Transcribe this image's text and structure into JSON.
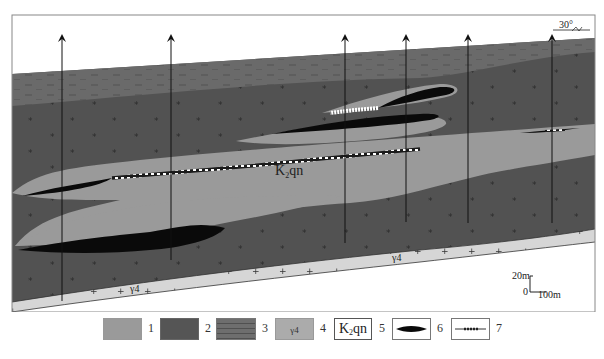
{
  "figure": {
    "type": "geological cross-section",
    "strike_label": "30°",
    "formation_label": "K₂qn",
    "granite_label": "γ4",
    "scale_bar": {
      "vertical": "20m",
      "origin": "0",
      "horizontal": "100m"
    },
    "boreholes": [
      {
        "x": 62,
        "top": 36,
        "bottom": 301
      },
      {
        "x": 171,
        "top": 36,
        "bottom": 260
      },
      {
        "x": 345,
        "top": 36,
        "bottom": 243
      },
      {
        "x": 406,
        "top": 36,
        "bottom": 222
      },
      {
        "x": 468,
        "top": 36,
        "bottom": 223
      },
      {
        "x": 552,
        "top": 36,
        "bottom": 223
      }
    ]
  },
  "legend": {
    "items": [
      {
        "num": "1",
        "description": "sandstone",
        "color": "#9a9a9a"
      },
      {
        "num": "2",
        "description": "mudstone",
        "color": "#555555"
      },
      {
        "num": "3",
        "description": "siltstone/shale",
        "color": "#6e6e6e"
      },
      {
        "num": "4",
        "description": "granite γ4",
        "label": "γ4",
        "color": "#d4d4d4"
      },
      {
        "num": "5",
        "description": "formation code",
        "label": "K₂qn"
      },
      {
        "num": "6",
        "description": "ore body"
      },
      {
        "num": "7",
        "description": "mineralized zone"
      }
    ]
  },
  "colors": {
    "sandstone": "#9a9a9a",
    "mudstone": "#525252",
    "siltstone": "#6a6a6a",
    "granite": "#d6d6d6",
    "ore": "#0a0a0a",
    "frame": "#888888"
  }
}
